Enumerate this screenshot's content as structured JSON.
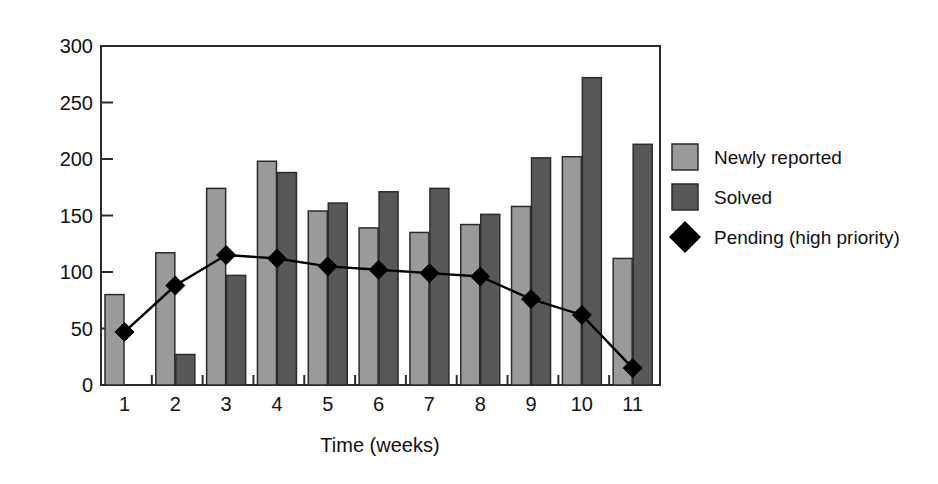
{
  "chart_data": {
    "type": "bar",
    "title": "",
    "subtitle": "",
    "xlabel": "Time (weeks)",
    "ylabel": "",
    "categories": [
      "1",
      "2",
      "3",
      "4",
      "5",
      "6",
      "7",
      "8",
      "9",
      "10",
      "11"
    ],
    "ylim": [
      0,
      300
    ],
    "yticks": [
      0,
      50,
      100,
      150,
      200,
      250,
      300
    ],
    "ytick_labels": [
      "0",
      "50",
      "100",
      "150",
      "200",
      "250",
      "300"
    ],
    "grid": false,
    "legend_position": "right",
    "series": [
      {
        "name": "Newly reported",
        "kind": "bar",
        "color": "#9a9a9a",
        "values": [
          80,
          117,
          174,
          198,
          154,
          139,
          135,
          142,
          158,
          202,
          112
        ]
      },
      {
        "name": "Solved",
        "kind": "bar",
        "color": "#585858",
        "values": [
          null,
          27,
          97,
          188,
          161,
          171,
          174,
          151,
          201,
          272,
          213
        ]
      },
      {
        "name": "Pending (high priority)",
        "kind": "line-marker",
        "color": "#000000",
        "marker": "diamond",
        "values": [
          47,
          88,
          115,
          112,
          105,
          102,
          99,
          96,
          76,
          62,
          15
        ]
      }
    ]
  },
  "legend": {
    "items": [
      {
        "label": "Newly reported",
        "marker": "square",
        "color": "#9a9a9a"
      },
      {
        "label": "Solved",
        "marker": "square",
        "color": "#585858"
      },
      {
        "label": "Pending (high priority)",
        "marker": "diamond",
        "color": "#000000"
      }
    ]
  },
  "axis": {
    "x_label": "Time (weeks)",
    "x_tick_labels": [
      "1",
      "2",
      "3",
      "4",
      "5",
      "6",
      "7",
      "8",
      "9",
      "10",
      "11"
    ],
    "y_tick_labels": [
      "300",
      "250",
      "200",
      "150",
      "100",
      "50",
      "0"
    ]
  },
  "colors": {
    "light_bar": "#9a9a9a",
    "dark_bar": "#585858",
    "line": "#000000",
    "frame": "#2b2b2b",
    "background": "#ffffff"
  }
}
